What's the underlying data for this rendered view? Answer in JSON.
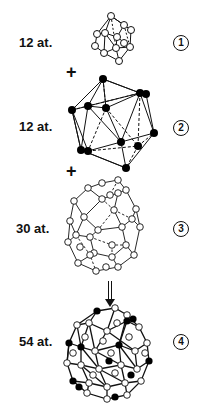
{
  "figure": {
    "steps": [
      {
        "index": "1",
        "atoms_label": "12 at.",
        "shape": "icosahedron",
        "atom_fill": "#ffffff"
      },
      {
        "index": "2",
        "atoms_label": "12 at.",
        "shape": "icosahedron",
        "atom_fill": "#000000"
      },
      {
        "index": "3",
        "atoms_label": "30 at.",
        "shape": "icosidodecahedron",
        "atom_fill": "#ffffff"
      },
      {
        "index": "4",
        "atoms_label": "54 at.",
        "shape": "combined-cluster",
        "atom_fill": "mixed"
      }
    ],
    "operators": [
      "+",
      "+"
    ],
    "arrow": "down-arrow",
    "colors": {
      "ink": "#111111",
      "background": "#ffffff"
    }
  }
}
